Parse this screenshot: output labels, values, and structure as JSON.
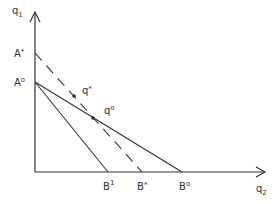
{
  "axes": {
    "y_label": "q",
    "y_label_sub": "1",
    "x_label": "q",
    "x_label_sub": "2"
  },
  "points": {
    "a_star": {
      "label": "A",
      "sup": "*"
    },
    "a_zero": {
      "label": "A",
      "sup": "o"
    },
    "b_one": {
      "label": "B",
      "sup": "1"
    },
    "b_star": {
      "label": "B",
      "sup": "*"
    },
    "b_zero": {
      "label": "B",
      "sup": "o"
    },
    "q_star": {
      "label": "q",
      "sup": "*"
    },
    "q_zero": {
      "label": "q",
      "sup": "o"
    }
  },
  "lines": [
    {
      "name": "A0-B0",
      "style": "solid"
    },
    {
      "name": "A0-B1",
      "style": "solid"
    },
    {
      "name": "Astar-Bstar",
      "style": "dashed"
    }
  ],
  "colors": {
    "ink": "#333333"
  }
}
